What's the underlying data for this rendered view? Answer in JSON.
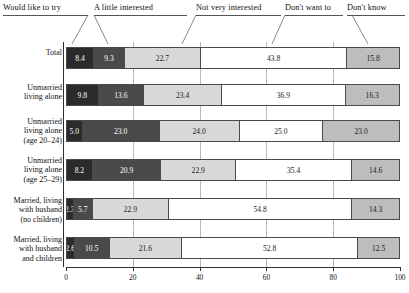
{
  "chart_data": {
    "type": "bar",
    "orientation": "horizontal",
    "stacked": true,
    "normalized_percent": true,
    "title": "",
    "xlabel": "",
    "ylabel": "",
    "xlim": [
      0,
      100
    ],
    "xticks": [
      0,
      20,
      40,
      60,
      80,
      100
    ],
    "xtick_labels": [
      "0",
      "20",
      "40",
      "60",
      "80",
      "100"
    ],
    "grid": true,
    "legend_position": "top",
    "legend": [
      "Would like to try",
      "A little interested",
      "Not very interested",
      "Don't want to",
      "Don't know"
    ],
    "series": [
      {
        "name": "Would like to try",
        "values": [
          8.4,
          9.8,
          5.0,
          8.2,
          2.3,
          2.6
        ]
      },
      {
        "name": "A little interested",
        "values": [
          9.3,
          13.6,
          23.0,
          20.9,
          5.7,
          10.5
        ]
      },
      {
        "name": "Not very interested",
        "values": [
          22.7,
          23.4,
          24.0,
          22.9,
          22.9,
          21.6
        ]
      },
      {
        "name": "Don't want to",
        "values": [
          43.8,
          36.9,
          25.0,
          35.4,
          54.8,
          52.8
        ]
      },
      {
        "name": "Don't know",
        "values": [
          15.8,
          16.3,
          23.0,
          14.6,
          14.3,
          12.5
        ]
      }
    ],
    "categories": [
      "Total",
      "Unmarried living alone",
      "Unmarried living alone (age 20–24)",
      "Unmarried living alone (age 25–29)",
      "Married, living with husband (no children)",
      "Married, living with husband and children"
    ],
    "series_colors": [
      "#2b2b2b",
      "#4a4a4a",
      "#d8d8d8",
      "#ffffff",
      "#bdbdbd"
    ]
  },
  "legend": {
    "items": [
      {
        "label": "Would like to try",
        "key": "would-like-to-try"
      },
      {
        "label": "A little interested",
        "key": "a-little-interested"
      },
      {
        "label": "Not very interested",
        "key": "not-very-interested"
      },
      {
        "label": "Don't want to",
        "key": "dont-want-to"
      },
      {
        "label": "Don't know",
        "key": "dont-know"
      }
    ]
  },
  "rows": [
    {
      "label_lines": [
        "Total"
      ],
      "values": [
        "8.4",
        "9.3",
        "22.7",
        "43.8",
        "15.8"
      ],
      "nums": [
        8.4,
        9.3,
        22.7,
        43.8,
        15.8
      ]
    },
    {
      "label_lines": [
        "Unmarried",
        "living alone"
      ],
      "values": [
        "9.8",
        "13.6",
        "23.4",
        "36.9",
        "16.3"
      ],
      "nums": [
        9.8,
        13.6,
        23.4,
        36.9,
        16.3
      ]
    },
    {
      "label_lines": [
        "Unmarried",
        "living alone",
        "(age 20–24)"
      ],
      "values": [
        "5.0",
        "23.0",
        "24.0",
        "25.0",
        "23.0"
      ],
      "nums": [
        5.0,
        23.0,
        24.0,
        25.0,
        23.0
      ]
    },
    {
      "label_lines": [
        "Unmarried",
        "living alone",
        "(age 25–29)"
      ],
      "values": [
        "8.2",
        "20.9",
        "22.9",
        "35.4",
        "14.6"
      ],
      "nums": [
        8.2,
        20.9,
        22.9,
        35.4,
        14.6
      ]
    },
    {
      "label_lines": [
        "Married, living",
        "with husband",
        "(no children)"
      ],
      "values": [
        "2.3",
        "5.7",
        "22.9",
        "54.8",
        "14.3"
      ],
      "nums": [
        2.3,
        5.7,
        22.9,
        54.8,
        14.3
      ]
    },
    {
      "label_lines": [
        "Married, living",
        "with husband",
        "and children"
      ],
      "values": [
        "2.6",
        "10.5",
        "21.6",
        "52.8",
        "12.5"
      ],
      "nums": [
        2.6,
        10.5,
        21.6,
        52.8,
        12.5
      ]
    }
  ],
  "axis": {
    "ticks": [
      "0",
      "20",
      "40",
      "60",
      "80",
      "100"
    ],
    "tick_values": [
      0,
      20,
      40,
      60,
      80,
      100
    ]
  }
}
